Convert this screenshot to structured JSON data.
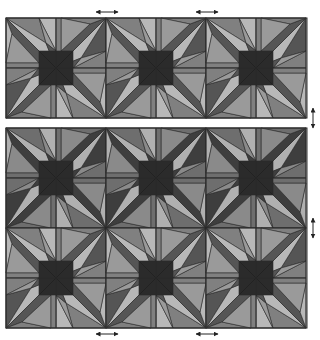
{
  "figure": {
    "width": 320,
    "height": 340,
    "tile_size": 100,
    "panels": [
      {
        "name": "top-panel",
        "x": 6,
        "y": 18,
        "cols": 3,
        "rows": 1,
        "row_variants": [
          "A"
        ]
      },
      {
        "name": "bottom-panel",
        "x": 6,
        "y": 128,
        "cols": 3,
        "rows": 2,
        "row_variants": [
          "B",
          "A"
        ]
      }
    ],
    "palettes": {
      "A": [
        "#b8b8b8",
        "#808080",
        "#555555",
        "#9a9a9a"
      ],
      "B": [
        "#b0b0b0",
        "#6e6e6e",
        "#3e3e3e",
        "#8a8a8a"
      ]
    },
    "center_square": {
      "half": 17,
      "color": "#2b2b2b"
    },
    "stroke": "#2a2a2a",
    "quadrant_polygons": [
      {
        "pts": [
          [
            0,
            0
          ],
          [
            33,
            0
          ],
          [
            40,
            25
          ]
        ],
        "shade": 1
      },
      {
        "pts": [
          [
            0,
            0
          ],
          [
            40,
            25
          ],
          [
            50,
            50
          ]
        ],
        "shade": 0
      },
      {
        "pts": [
          [
            0,
            0
          ],
          [
            50,
            50
          ],
          [
            33,
            45
          ],
          [
            6,
            16
          ]
        ],
        "shade": 2
      },
      {
        "pts": [
          [
            0,
            0
          ],
          [
            6,
            16
          ],
          [
            0,
            45
          ]
        ],
        "shade": 0
      },
      {
        "pts": [
          [
            0,
            45
          ],
          [
            6,
            16
          ],
          [
            33,
            45
          ]
        ],
        "shade": 3
      },
      {
        "pts": [
          [
            0,
            45
          ],
          [
            33,
            45
          ],
          [
            50,
            50
          ],
          [
            0,
            50
          ]
        ],
        "shade": 1
      },
      {
        "pts": [
          [
            33,
            0
          ],
          [
            50,
            0
          ],
          [
            50,
            33
          ]
        ],
        "shade": 0
      },
      {
        "pts": [
          [
            33,
            0
          ],
          [
            50,
            33
          ],
          [
            40,
            25
          ]
        ],
        "shade": 3
      },
      {
        "pts": [
          [
            40,
            25
          ],
          [
            50,
            33
          ],
          [
            50,
            50
          ]
        ],
        "shade": 2
      }
    ],
    "arrows": [
      {
        "name": "top-left-h-arrow",
        "dir": "h",
        "x1": 96,
        "y1": 12,
        "x2": 118,
        "y2": 12
      },
      {
        "name": "top-right-h-arrow",
        "dir": "h",
        "x1": 196,
        "y1": 12,
        "x2": 218,
        "y2": 12
      },
      {
        "name": "bottom-left-h-arrow",
        "dir": "h",
        "x1": 96,
        "y1": 334,
        "x2": 118,
        "y2": 334
      },
      {
        "name": "bottom-right-h-arrow",
        "dir": "h",
        "x1": 196,
        "y1": 334,
        "x2": 218,
        "y2": 334
      },
      {
        "name": "upper-v-arrow",
        "dir": "v",
        "x1": 313,
        "y1": 108,
        "x2": 313,
        "y2": 128
      },
      {
        "name": "lower-v-arrow",
        "dir": "v",
        "x1": 313,
        "y1": 218,
        "x2": 313,
        "y2": 238
      }
    ],
    "arrow_color": "#222222"
  }
}
